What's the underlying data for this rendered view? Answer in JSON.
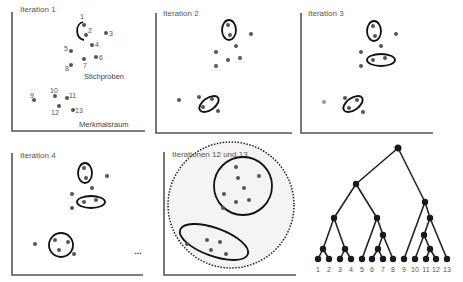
{
  "panels": [
    {
      "id": "iteration-1",
      "title": "Iteration 1",
      "annotation": "Stichproben",
      "axis_label": "Merkmalsraum"
    },
    {
      "id": "iteration-2",
      "title": "Iteration 2"
    },
    {
      "id": "iteration-3",
      "title": "Iteration 3"
    },
    {
      "id": "iteration-4",
      "title": "Iteration 4"
    },
    {
      "id": "iterations-12-13",
      "title": "Iterationen 12 und 13"
    }
  ],
  "ellipsis": "...",
  "sample_labels": [
    "1",
    "2",
    "3",
    "4",
    "5",
    "6",
    "7",
    "8",
    "9",
    "10",
    "11",
    "12",
    "13"
  ],
  "dendrogram": {
    "leaf_labels": [
      "1",
      "2",
      "3",
      "4",
      "5",
      "6",
      "7",
      "8",
      "9",
      "10",
      "11",
      "12",
      "13"
    ]
  },
  "colors": {
    "axis": "#555555",
    "point": "#555555",
    "cluster_outline": "#111111",
    "tree": "#1a1a1a"
  }
}
